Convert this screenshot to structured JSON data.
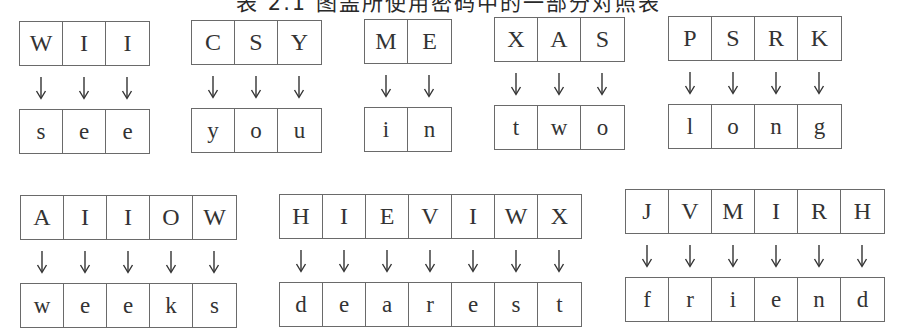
{
  "title": "表 2.1  图盖所使用密码中的一部分对照表",
  "mappings": [
    {
      "cipher": [
        "W",
        "I",
        "I"
      ],
      "plain": [
        "s",
        "e",
        "e"
      ],
      "word": "see",
      "pos": {
        "left": 19,
        "top": 21
      }
    },
    {
      "cipher": [
        "C",
        "S",
        "Y"
      ],
      "plain": [
        "y",
        "o",
        "u"
      ],
      "word": "you",
      "pos": {
        "left": 191,
        "top": 20
      }
    },
    {
      "cipher": [
        "M",
        "E"
      ],
      "plain": [
        "i",
        "n"
      ],
      "word": "in",
      "pos": {
        "left": 364,
        "top": 19
      }
    },
    {
      "cipher": [
        "X",
        "A",
        "S"
      ],
      "plain": [
        "t",
        "w",
        "o"
      ],
      "word": "two",
      "pos": {
        "left": 494,
        "top": 17
      }
    },
    {
      "cipher": [
        "P",
        "S",
        "R",
        "K"
      ],
      "plain": [
        "l",
        "o",
        "n",
        "g"
      ],
      "word": "long",
      "pos": {
        "left": 668,
        "top": 16
      }
    },
    {
      "cipher": [
        "A",
        "I",
        "I",
        "O",
        "W"
      ],
      "plain": [
        "w",
        "e",
        "e",
        "k",
        "s"
      ],
      "word": "weeks",
      "pos": {
        "left": 20,
        "top": 195
      }
    },
    {
      "cipher": [
        "H",
        "I",
        "E",
        "V",
        "I",
        "W",
        "X"
      ],
      "plain": [
        "d",
        "e",
        "a",
        "r",
        "e",
        "s",
        "t"
      ],
      "word": "dearest",
      "pos": {
        "left": 279,
        "top": 194
      }
    },
    {
      "cipher": [
        "J",
        "V",
        "M",
        "I",
        "R",
        "H"
      ],
      "plain": [
        "f",
        "r",
        "i",
        "e",
        "n",
        "d"
      ],
      "word": "friend",
      "pos": {
        "left": 625,
        "top": 189
      }
    }
  ],
  "arrow_glyph": "↓",
  "colors": {
    "border": "#6a6a6a",
    "text": "#333333",
    "background": "#ffffff"
  }
}
